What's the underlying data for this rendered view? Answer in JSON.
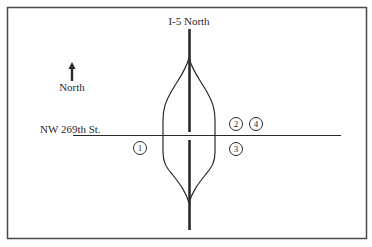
{
  "diagram": {
    "type": "interchange-map",
    "highway_label": "I-5 North",
    "cross_street_label": "NW 269th St.",
    "compass_label": "North",
    "compass_direction": "up",
    "markers": [
      {
        "id": "1",
        "label": "1",
        "position": "southwest of interchange, below NW 269th St."
      },
      {
        "id": "2",
        "label": "2",
        "position": "northeast of interchange, above NW 269th St."
      },
      {
        "id": "3",
        "label": "3",
        "position": "southeast of interchange, below NW 269th St."
      },
      {
        "id": "4",
        "label": "4",
        "position": "northeast, right of marker 2, above NW 269th St."
      }
    ],
    "colors": {
      "line": "#2a2a2a",
      "frame": "#4a4a4a",
      "background": "#ffffff"
    }
  }
}
